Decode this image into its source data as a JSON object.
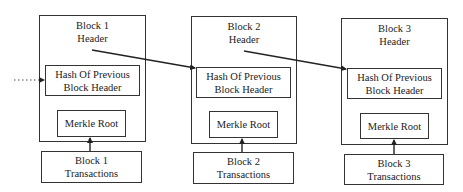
{
  "diagram": {
    "type": "blockchain-structure",
    "colors": {
      "line": "#222222",
      "border": "#333333",
      "background": "#ffffff"
    },
    "blocks": [
      {
        "header_line1": "Block 1",
        "header_line2": "Header",
        "hash_line1": "Hash Of Previous",
        "hash_line2": "Block Header",
        "merkle": "Merkle Root",
        "tx_line1": "Block 1",
        "tx_line2": "Transactions"
      },
      {
        "header_line1": "Block 2",
        "header_line2": "Header",
        "hash_line1": "Hash Of Previous",
        "hash_line2": "Block Header",
        "merkle": "Merkle Root",
        "tx_line1": "Block 2",
        "tx_line2": "Transactions"
      },
      {
        "header_line1": "Block 3",
        "header_line2": "Header",
        "hash_line1": "Hash Of Previous",
        "hash_line2": "Block Header",
        "merkle": "Merkle Root",
        "tx_line1": "Block 3",
        "tx_line2": "Transactions"
      }
    ],
    "edges": [
      {
        "from": "previous-block (dotted)",
        "to": "Block 1 Hash Of Previous Block Header"
      },
      {
        "from": "Block 1 Header",
        "to": "Block 2 Hash Of Previous Block Header"
      },
      {
        "from": "Block 2 Header",
        "to": "Block 3 Hash Of Previous Block Header"
      },
      {
        "from": "Block 1 Transactions",
        "to": "Block 1 Merkle Root"
      },
      {
        "from": "Block 2 Transactions",
        "to": "Block 2 Merkle Root"
      },
      {
        "from": "Block 3 Transactions",
        "to": "Block 3 Merkle Root"
      }
    ]
  }
}
